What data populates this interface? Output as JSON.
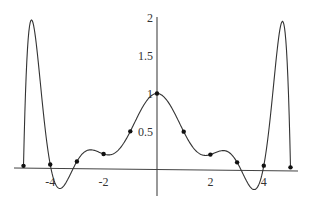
{
  "chart_data": {
    "type": "line",
    "title": "",
    "xlabel": "",
    "ylabel": "",
    "xlim": [
      -5.3,
      5.5
    ],
    "ylim": [
      -0.35,
      2.0
    ],
    "grid": false,
    "legend": null,
    "x_ticks": [
      {
        "value": -4,
        "label": "-4"
      },
      {
        "value": -2,
        "label": "-2"
      },
      {
        "value": 2,
        "label": "2"
      },
      {
        "value": 4,
        "label": "4"
      }
    ],
    "y_ticks": [
      {
        "value": 0.5,
        "label": "0.5"
      },
      {
        "value": 1,
        "label": "1"
      },
      {
        "value": 1.5,
        "label": "1.5"
      },
      {
        "value": 2,
        "label": "2"
      }
    ],
    "series": [
      {
        "name": "interpolating polynomial (degree 10) of 1/(1+x^2)",
        "kind": "curve",
        "function": "runge_interpolant",
        "domain": [
          -5,
          5
        ],
        "color": "#333333"
      },
      {
        "name": "interpolation nodes",
        "kind": "points",
        "color": "#111111",
        "x": [
          -5,
          -4,
          -3,
          -2,
          -1,
          0,
          1,
          2,
          3,
          4,
          5
        ],
        "y": [
          0.0385,
          0.0588,
          0.1,
          0.2,
          0.5,
          1.0,
          0.5,
          0.2,
          0.1,
          0.0588,
          0.0385
        ]
      }
    ]
  }
}
